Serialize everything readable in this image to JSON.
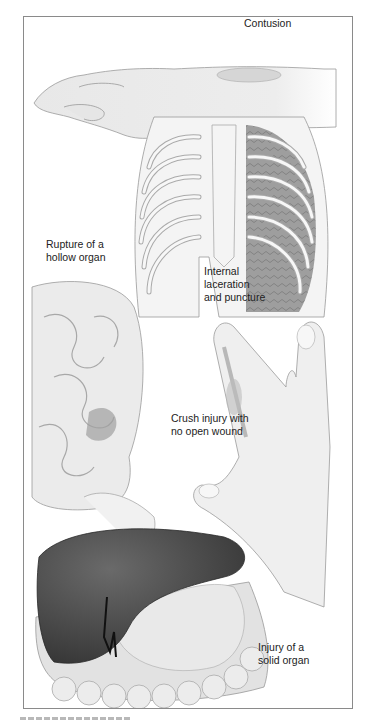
{
  "figure": {
    "labels": {
      "contusion": "Contusion",
      "rupture_hollow": "Rupture of a\nhollow organ",
      "internal_laceration": "Internal\nlaceration\nand puncture",
      "crush_injury": "Crush injury with\nno open wound",
      "solid_organ": "Injury of a\nsolid organ"
    },
    "illustrations": [
      "forearm-with-contusion",
      "rib-cage-with-lung-laceration",
      "small-intestine-rupture",
      "hand-with-crushed-finger",
      "liver-and-colon-injury"
    ],
    "colors": {
      "line": "#8a8a8a",
      "skin": "#ececec",
      "liver": "#4a4a4a",
      "lung": "#8c8c8c"
    }
  }
}
